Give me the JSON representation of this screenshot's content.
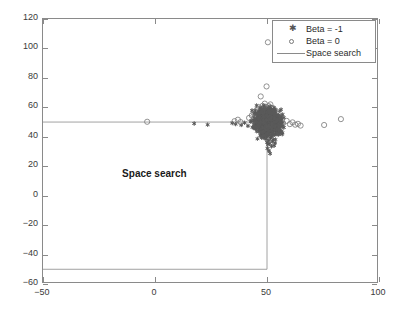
{
  "chart_data": {
    "type": "scatter",
    "title": "",
    "xlabel": "",
    "ylabel": "",
    "xlim": [
      -50,
      100
    ],
    "ylim": [
      -60,
      120
    ],
    "xticks": [
      -50,
      0,
      50,
      100
    ],
    "yticks": [
      -60,
      -40,
      -20,
      0,
      20,
      40,
      60,
      80,
      100,
      120
    ],
    "xtick_labels": [
      "-50",
      "0",
      "50",
      "100"
    ],
    "ytick_labels": [
      "-60",
      "-40",
      "-20",
      "0",
      "20",
      "40",
      "60",
      "80",
      "100",
      "120"
    ],
    "grid": false,
    "legend_position": "upper right",
    "legend": [
      {
        "label": "Beta = -1",
        "marker": "star",
        "color": "#555555"
      },
      {
        "label": "Beta = 0",
        "marker": "circle-open",
        "color": "#777777"
      },
      {
        "label": "Space search",
        "marker": "line",
        "color": "#8a8a8a"
      }
    ],
    "annotations": [
      {
        "text": "Space search",
        "x": 0.5,
        "y": 14,
        "bold": true
      }
    ],
    "series": [
      {
        "name": "Beta = -1",
        "marker": "star",
        "color": "#555555",
        "points": [
          [
            17.5,
            49.0
          ],
          [
            23.5,
            48.2
          ],
          [
            34.5,
            49.3
          ],
          [
            36.0,
            48.6
          ],
          [
            38.5,
            48.0
          ],
          [
            40.0,
            49.5
          ],
          [
            41.5,
            47.4
          ],
          [
            42.8,
            50.2
          ],
          [
            43.5,
            46.5
          ],
          [
            44.2,
            51.0
          ],
          [
            44.8,
            48.3
          ],
          [
            45.3,
            45.8
          ],
          [
            45.9,
            52.4
          ],
          [
            46.2,
            47.0
          ],
          [
            46.6,
            50.8
          ],
          [
            46.9,
            44.6
          ],
          [
            47.2,
            53.1
          ],
          [
            47.5,
            48.9
          ],
          [
            47.8,
            46.2
          ],
          [
            48.0,
            51.6
          ],
          [
            48.2,
            43.9
          ],
          [
            48.4,
            49.7
          ],
          [
            48.6,
            54.0
          ],
          [
            48.8,
            47.1
          ],
          [
            49.0,
            52.0
          ],
          [
            49.1,
            45.4
          ],
          [
            49.3,
            50.3
          ],
          [
            49.4,
            55.2
          ],
          [
            49.5,
            48.0
          ],
          [
            49.6,
            42.8
          ],
          [
            49.7,
            53.4
          ],
          [
            49.8,
            46.8
          ],
          [
            49.9,
            51.2
          ],
          [
            50.0,
            49.0
          ],
          [
            50.1,
            56.1
          ],
          [
            50.2,
            44.2
          ],
          [
            50.3,
            52.7
          ],
          [
            50.4,
            47.6
          ],
          [
            50.5,
            50.9
          ],
          [
            50.6,
            41.5
          ],
          [
            50.7,
            54.8
          ],
          [
            50.8,
            46.0
          ],
          [
            50.9,
            51.8
          ],
          [
            51.0,
            48.4
          ],
          [
            51.1,
            57.0
          ],
          [
            51.2,
            43.3
          ],
          [
            51.3,
            53.0
          ],
          [
            51.4,
            49.6
          ],
          [
            51.5,
            45.1
          ],
          [
            51.6,
            52.2
          ],
          [
            51.8,
            47.9
          ],
          [
            52.0,
            55.6
          ],
          [
            52.2,
            50.5
          ],
          [
            52.4,
            42.1
          ],
          [
            52.6,
            48.7
          ],
          [
            52.8,
            53.8
          ],
          [
            53.0,
            46.4
          ],
          [
            53.2,
            51.4
          ],
          [
            53.5,
            44.8
          ],
          [
            53.8,
            49.2
          ],
          [
            54.0,
            54.4
          ],
          [
            54.3,
            47.3
          ],
          [
            54.6,
            50.0
          ],
          [
            55.0,
            52.9
          ],
          [
            55.4,
            45.6
          ],
          [
            55.8,
            48.5
          ],
          [
            56.2,
            51.1
          ],
          [
            56.6,
            47.0
          ],
          [
            57.0,
            49.8
          ],
          [
            57.5,
            46.3
          ],
          [
            49.5,
            38.5
          ],
          [
            50.0,
            36.2
          ],
          [
            50.4,
            34.8
          ],
          [
            50.8,
            37.6
          ],
          [
            51.2,
            35.4
          ],
          [
            51.6,
            39.0
          ],
          [
            52.0,
            33.5
          ],
          [
            52.4,
            36.8
          ],
          [
            52.8,
            38.2
          ],
          [
            53.2,
            34.0
          ],
          [
            49.8,
            40.6
          ],
          [
            50.6,
            41.8
          ],
          [
            51.8,
            40.2
          ],
          [
            52.6,
            41.1
          ],
          [
            50.2,
            32.1
          ],
          [
            50.9,
            30.4
          ],
          [
            51.4,
            28.6
          ],
          [
            53.6,
            35.8
          ],
          [
            48.5,
            40.0
          ],
          [
            47.8,
            42.5
          ],
          [
            47.0,
            41.0
          ],
          [
            46.4,
            43.5
          ],
          [
            53.8,
            42.0
          ],
          [
            54.5,
            43.2
          ],
          [
            55.2,
            41.6
          ],
          [
            56.0,
            44.0
          ],
          [
            49.2,
            58.2
          ],
          [
            50.5,
            59.0
          ],
          [
            51.9,
            58.6
          ],
          [
            48.9,
            57.3
          ],
          [
            52.5,
            57.8
          ],
          [
            53.4,
            56.4
          ],
          [
            47.4,
            55.0
          ],
          [
            46.8,
            53.2
          ]
        ]
      },
      {
        "name": "Beta = 0",
        "marker": "circle-open",
        "color": "#777777",
        "points": [
          [
            -3.5,
            50.2
          ],
          [
            35.5,
            50.6
          ],
          [
            37.0,
            51.6
          ],
          [
            38.2,
            50.0
          ],
          [
            44.0,
            56.0
          ],
          [
            45.5,
            58.4
          ],
          [
            46.5,
            60.0
          ],
          [
            48.0,
            61.0
          ],
          [
            49.4,
            60.4
          ],
          [
            50.8,
            60.8
          ],
          [
            52.2,
            59.6
          ],
          [
            53.6,
            58.0
          ],
          [
            47.2,
            67.4
          ],
          [
            49.8,
            74.2
          ],
          [
            50.4,
            104.2
          ],
          [
            55.5,
            50.4
          ],
          [
            57.2,
            49.2
          ],
          [
            58.8,
            50.8
          ],
          [
            60.2,
            48.6
          ],
          [
            61.4,
            49.8
          ],
          [
            62.6,
            48.2
          ],
          [
            63.8,
            48.8
          ],
          [
            65.0,
            47.6
          ],
          [
            75.5,
            48.0
          ],
          [
            83.0,
            52.0
          ],
          [
            43.2,
            54.5
          ],
          [
            42.0,
            52.8
          ],
          [
            54.8,
            55.2
          ],
          [
            56.4,
            53.6
          ],
          [
            49.0,
            62.5
          ],
          [
            51.5,
            62.0
          ]
        ]
      }
    ],
    "reference_lines": [
      {
        "name": "space-search-boundary",
        "type": "polyline",
        "points": [
          [
            -50,
            50
          ],
          [
            50,
            50
          ],
          [
            50,
            -50
          ],
          [
            -50,
            -50
          ]
        ],
        "color": "#8a8a8a"
      }
    ]
  }
}
